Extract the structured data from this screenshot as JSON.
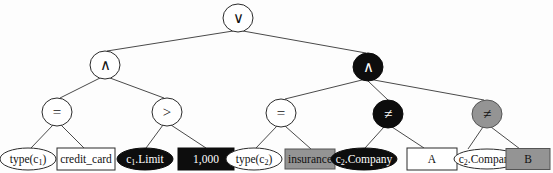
{
  "figure": {
    "type": "expression-tree",
    "width": 553,
    "height": 173,
    "background_color": "#fdfdfd"
  },
  "palette": {
    "white_fill": "#ffffff",
    "black_fill": "#0d0d0d",
    "gray_fill": "#949494",
    "stroke": "#2b2b2b",
    "edge": "#4a4a4a",
    "dark_text": "#111111",
    "light_text": "#ffffff"
  },
  "nodes": [
    {
      "id": "root-or",
      "label": "∨",
      "shape": "circle",
      "fill": "white",
      "text_color": "dark",
      "x": 238,
      "y": 18,
      "rx": 15,
      "ry": 14,
      "level": 0
    },
    {
      "id": "and-left",
      "label": "∧",
      "shape": "circle",
      "fill": "white",
      "text_color": "dark",
      "x": 105,
      "y": 65,
      "rx": 15,
      "ry": 14,
      "level": 1
    },
    {
      "id": "and-right",
      "label": "∧",
      "shape": "circle",
      "fill": "black",
      "text_color": "light",
      "x": 368,
      "y": 67,
      "rx": 15,
      "ry": 14,
      "level": 1
    },
    {
      "id": "eq-left",
      "label": "=",
      "shape": "circle",
      "fill": "white",
      "text_color": "dark",
      "x": 57,
      "y": 112,
      "rx": 15,
      "ry": 14,
      "level": 2
    },
    {
      "id": "gt-left",
      "label": ">",
      "shape": "circle",
      "fill": "white",
      "text_color": "dark",
      "x": 167,
      "y": 112,
      "rx": 15,
      "ry": 14,
      "level": 2
    },
    {
      "id": "eq-right",
      "label": "=",
      "shape": "circle",
      "fill": "white",
      "text_color": "dark",
      "x": 281,
      "y": 113,
      "rx": 15,
      "ry": 14,
      "level": 2
    },
    {
      "id": "neq-black",
      "label": "≠",
      "shape": "circle",
      "fill": "black",
      "text_color": "light",
      "x": 388,
      "y": 114,
      "rx": 15,
      "ry": 14,
      "level": 2
    },
    {
      "id": "neq-gray",
      "label": "≠",
      "shape": "circle",
      "fill": "gray",
      "text_color": "dark",
      "x": 487,
      "y": 114,
      "rx": 15,
      "ry": 14,
      "level": 2
    }
  ],
  "leaves": [
    {
      "id": "leaf-type-c1",
      "label": "type(c₁)",
      "text_main": "type(c",
      "text_sub": "1",
      "text_tail": ")",
      "shape": "ellipse",
      "fill": "white",
      "text_color": "dark",
      "x": 28,
      "y": 159,
      "w": 56,
      "h": 22
    },
    {
      "id": "leaf-credit-card",
      "label": "credit_card",
      "shape": "rect",
      "fill": "white",
      "text_color": "dark",
      "x": 86,
      "y": 159,
      "w": 58,
      "h": 22
    },
    {
      "id": "leaf-c1-limit",
      "label": "c₁.Limit",
      "text_main": "c",
      "text_sub": "1",
      "text_tail": ".Limit",
      "shape": "ellipse",
      "fill": "black",
      "text_color": "light",
      "x": 145,
      "y": 159,
      "w": 56,
      "h": 22
    },
    {
      "id": "leaf-1000",
      "label": "1,000",
      "shape": "rect",
      "fill": "black",
      "text_color": "light",
      "x": 206,
      "y": 159,
      "w": 56,
      "h": 22
    },
    {
      "id": "leaf-type-c2",
      "label": "type(c₂)",
      "text_main": "type(c",
      "text_sub": "2",
      "text_tail": ")",
      "shape": "ellipse",
      "fill": "white",
      "text_color": "dark",
      "x": 254,
      "y": 159,
      "w": 56,
      "h": 22
    },
    {
      "id": "leaf-insurance",
      "label": "insurance",
      "shape": "rect",
      "fill": "gray",
      "text_color": "dark",
      "x": 310,
      "y": 159,
      "w": 50,
      "h": 20
    },
    {
      "id": "leaf-c2-company-black",
      "label": "c₂.Company",
      "text_main": "c",
      "text_sub": "2",
      "text_tail": ".Company",
      "shape": "ellipse",
      "fill": "black",
      "text_color": "light",
      "x": 364,
      "y": 159,
      "w": 66,
      "h": 22
    },
    {
      "id": "leaf-a",
      "label": "A",
      "shape": "rect",
      "fill": "white",
      "text_color": "dark",
      "x": 432,
      "y": 159,
      "w": 50,
      "h": 22
    },
    {
      "id": "leaf-c2-company-white",
      "label": "c₂.Company",
      "text_main": "c",
      "text_sub": "2",
      "text_tail": ".Company",
      "shape": "ellipse",
      "fill": "white",
      "text_color": "dark",
      "x": 487,
      "y": 159,
      "w": 66,
      "h": 20
    },
    {
      "id": "leaf-b",
      "label": "B",
      "shape": "rect",
      "fill": "gray",
      "text_color": "dark",
      "x": 528,
      "y": 159,
      "w": 44,
      "h": 21
    }
  ],
  "edges": [
    {
      "from": "root-or",
      "to": "and-left",
      "x1": 233,
      "y1": 31,
      "x2": 107,
      "y2": 51
    },
    {
      "from": "root-or",
      "to": "and-right",
      "x1": 243,
      "y1": 31,
      "x2": 366,
      "y2": 53
    },
    {
      "from": "and-left",
      "to": "eq-left",
      "x1": 100,
      "y1": 78,
      "x2": 60,
      "y2": 98
    },
    {
      "from": "and-left",
      "to": "gt-left",
      "x1": 110,
      "y1": 78,
      "x2": 164,
      "y2": 98
    },
    {
      "from": "and-right",
      "to": "eq-right",
      "x1": 362,
      "y1": 80,
      "x2": 285,
      "y2": 99
    },
    {
      "from": "and-right",
      "to": "neq-black",
      "x1": 368,
      "y1": 81,
      "x2": 388,
      "y2": 100
    },
    {
      "from": "and-right",
      "to": "neq-gray",
      "x1": 374,
      "y1": 80,
      "x2": 484,
      "y2": 100
    },
    {
      "from": "eq-left",
      "to": "leaf-type-c1",
      "x1": 53,
      "y1": 125,
      "x2": 31,
      "y2": 148
    },
    {
      "from": "eq-left",
      "to": "leaf-credit-card",
      "x1": 61,
      "y1": 125,
      "x2": 84,
      "y2": 148
    },
    {
      "from": "gt-left",
      "to": "leaf-c1-limit",
      "x1": 163,
      "y1": 125,
      "x2": 146,
      "y2": 148
    },
    {
      "from": "gt-left",
      "to": "leaf-1000",
      "x1": 171,
      "y1": 125,
      "x2": 206,
      "y2": 148
    },
    {
      "from": "eq-right",
      "to": "leaf-type-c2",
      "x1": 277,
      "y1": 126,
      "x2": 256,
      "y2": 148
    },
    {
      "from": "eq-right",
      "to": "leaf-insurance",
      "x1": 285,
      "y1": 126,
      "x2": 311,
      "y2": 149
    },
    {
      "from": "neq-black",
      "to": "leaf-c2-company-black",
      "x1": 384,
      "y1": 127,
      "x2": 365,
      "y2": 148
    },
    {
      "from": "neq-black",
      "to": "leaf-a",
      "x1": 392,
      "y1": 127,
      "x2": 424,
      "y2": 148
    },
    {
      "from": "neq-gray",
      "to": "leaf-c2-company-white",
      "x1": 483,
      "y1": 127,
      "x2": 468,
      "y2": 149
    },
    {
      "from": "neq-gray",
      "to": "leaf-b",
      "x1": 491,
      "y1": 127,
      "x2": 520,
      "y2": 149
    }
  ]
}
